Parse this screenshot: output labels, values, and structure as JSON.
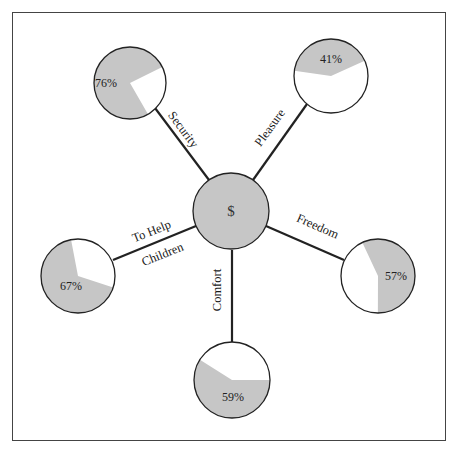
{
  "diagram": {
    "center": {
      "label": "$",
      "cx": 231,
      "cy": 211,
      "r": 38,
      "fill": "#c6c6c6"
    },
    "colors": {
      "filled": "#c6c6c6",
      "empty": "#ffffff",
      "stroke": "#222222"
    },
    "nodes": [
      {
        "id": "security",
        "label": "Security",
        "percent": 76,
        "percent_label": "76%",
        "cx": 130,
        "cy": 83,
        "r": 36,
        "start_angle": 150,
        "line": [
          152,
          104,
          209,
          180
        ],
        "label_x": 180,
        "label_y": 132,
        "label_rotate": 53,
        "pct_x": 106,
        "pct_y": 87
      },
      {
        "id": "pleasure",
        "label": "Pleasure",
        "percent": 41,
        "percent_label": "41%",
        "cx": 331,
        "cy": 76,
        "r": 37,
        "start_angle": 278,
        "line": [
          307,
          104,
          253,
          180
        ],
        "label_x": 273,
        "label_y": 130,
        "label_rotate": -54,
        "pct_x": 331,
        "pct_y": 63
      },
      {
        "id": "freedom",
        "label": "Freedom",
        "percent": 57,
        "percent_label": "57%",
        "cx": 378,
        "cy": 276,
        "r": 37,
        "start_angle": 335,
        "line": [
          266,
          226,
          344,
          260
        ],
        "label_x": 316,
        "label_y": 230,
        "label_rotate": 24,
        "pct_x": 396,
        "pct_y": 280
      },
      {
        "id": "comfort",
        "label": "Comfort",
        "percent": 59,
        "percent_label": "59%",
        "cx": 232,
        "cy": 380,
        "r": 38,
        "start_angle": 90,
        "line": [
          232,
          250,
          232,
          342
        ],
        "label_x": 221,
        "label_y": 290,
        "label_rotate": -90,
        "pct_x": 233,
        "pct_y": 401
      },
      {
        "id": "children",
        "label_lines": [
          "To Help",
          "Children"
        ],
        "label": "To Help Children",
        "percent": 67,
        "percent_label": "67%",
        "cx": 78,
        "cy": 276,
        "r": 37,
        "start_angle": 108,
        "line": [
          113,
          260,
          196,
          226
        ],
        "label_x": 153,
        "label_y": 235,
        "label_rotate": -22,
        "label2_x": 164,
        "label2_y": 258,
        "pct_x": 71,
        "pct_y": 290
      }
    ]
  }
}
